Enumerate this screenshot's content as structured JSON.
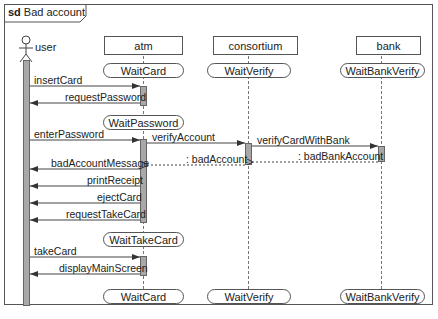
{
  "frame": {
    "keyword": "sd",
    "title": "Bad account"
  },
  "lifelines": [
    {
      "id": "user",
      "label": "user",
      "kind": "actor"
    },
    {
      "id": "atm",
      "label": "atm",
      "kind": "object"
    },
    {
      "id": "consortium",
      "label": "consortium",
      "kind": "object"
    },
    {
      "id": "bank",
      "label": "bank",
      "kind": "object"
    }
  ],
  "states": {
    "atm_initial": "WaitCard",
    "consortium_initial": "WaitVerify",
    "bank_initial": "WaitBankVerify",
    "atm_password": "WaitPassword",
    "atm_takecard": "WaitTakeCard",
    "atm_final": "WaitCard",
    "consortium_final": "WaitVerify",
    "bank_final": "WaitBankVerify"
  },
  "messages": [
    {
      "label": "insertCard",
      "from": "user",
      "to": "atm",
      "type": "sync"
    },
    {
      "label": "requestPassword",
      "from": "atm",
      "to": "user",
      "type": "sync"
    },
    {
      "label": "enterPassword",
      "from": "user",
      "to": "atm",
      "type": "sync"
    },
    {
      "label": "verifyAccount",
      "from": "atm",
      "to": "consortium",
      "type": "sync"
    },
    {
      "label": "verifyCardWithBank",
      "from": "consortium",
      "to": "bank",
      "type": "sync"
    },
    {
      "label": ": badBankAccount",
      "from": "bank",
      "to": "consortium",
      "type": "reply"
    },
    {
      "label": ": badAccount",
      "from": "consortium",
      "to": "atm",
      "type": "reply"
    },
    {
      "label": "badAccountMessage",
      "from": "atm",
      "to": "user",
      "type": "sync"
    },
    {
      "label": "printReceipt",
      "from": "atm",
      "to": "user",
      "type": "sync"
    },
    {
      "label": "ejectCard",
      "from": "atm",
      "to": "user",
      "type": "sync"
    },
    {
      "label": "requestTakeCard",
      "from": "atm",
      "to": "user",
      "type": "sync"
    },
    {
      "label": "takeCard",
      "from": "user",
      "to": "atm",
      "type": "sync"
    },
    {
      "label": "displayMainScreen",
      "from": "atm",
      "to": "user",
      "type": "sync"
    }
  ],
  "colors": {
    "line": "#555555",
    "activation": "#a8a8a8"
  }
}
